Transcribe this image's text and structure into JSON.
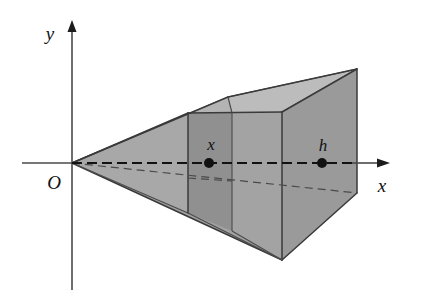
{
  "figure": {
    "type": "geometry-diagram",
    "background_color": "#ffffff",
    "axes": {
      "y_axis_label": "y",
      "x_axis_label": "x",
      "origin_label": "O",
      "x_axis_color": "#4a4a4a",
      "y_axis_color": "#4a4a4a"
    },
    "labels": {
      "cross_section": "x",
      "base_distance": "h"
    },
    "colors": {
      "front_face_fill": "#a3a3a3",
      "side_face_fill": "#9a9a9a",
      "top_face_fill": "#bcbcbc",
      "slab_face_fill": "#909090",
      "edge_stroke": "#3a3a3a",
      "dash_stroke": "#111111"
    },
    "points": {
      "apex": [
        72,
        163
      ],
      "cross_section_marker": [
        209,
        163
      ],
      "base_marker": [
        322,
        163
      ],
      "x_arrow_tip": [
        388,
        163
      ],
      "y_arrow_tip": [
        72,
        22
      ]
    }
  }
}
